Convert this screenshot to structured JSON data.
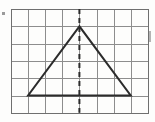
{
  "figure": {
    "background_color": "#fdfdfc",
    "grid": {
      "columns": 8,
      "rows": 6,
      "origin_x": 11,
      "origin_y": 9,
      "cell_width": 17.1,
      "cell_height": 17.3,
      "line_color": "#8d8d8d",
      "line_width": 1,
      "border_color": "#6f6f6f",
      "border_width": 1
    },
    "shape": {
      "name": "triangle",
      "type": "isosceles",
      "stroke_color": "#2b2b2b",
      "stroke_width": 2,
      "fill": "none",
      "vertices": [
        {
          "label": "apex",
          "grid_col": 4,
          "grid_row": 1,
          "x": 79.4,
          "y": 26.3
        },
        {
          "label": "base-left",
          "grid_col": 1,
          "grid_row": 5,
          "x": 28.1,
          "y": 95.5
        },
        {
          "label": "base-right",
          "grid_col": 7,
          "grid_row": 5,
          "x": 130.7,
          "y": 95.5
        }
      ],
      "base_width_cells": 6,
      "height_cells": 4
    },
    "symmetry_line": {
      "name": "line-of-symmetry",
      "orientation": "vertical",
      "style": "dashed",
      "stroke_color": "#2b2b2b",
      "stroke_width": 2,
      "dash_pattern": "5,4",
      "x": 79.4,
      "y_top": 9,
      "y_bottom": 112.8
    },
    "edge_marks": [
      {
        "name": "left-edge-mark",
        "x": 2,
        "y": 12,
        "width": 3,
        "height": 3,
        "color": "#9a9a9a"
      },
      {
        "name": "right-edge-tick",
        "x": 149,
        "y": 31,
        "width": 2,
        "height": 11,
        "color": "#b4b4b4"
      }
    ]
  }
}
